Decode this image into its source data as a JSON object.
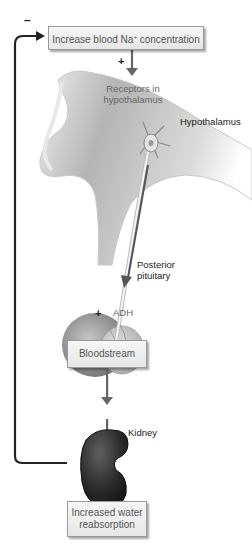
{
  "diagram": {
    "boxes": {
      "stimulus": "Increase blood Na",
      "stimulus_sup": "+",
      "stimulus_tail": " concentration",
      "bloodstream": "Bloodstream",
      "response_line1": "Increased water",
      "response_line2": "reabsorption"
    },
    "labels": {
      "receptors_line1": "Receptors in",
      "receptors_line2": "hypothalamus",
      "hypothalamus": "Hypothalamus",
      "posterior_line1": "Posterior",
      "posterior_line2": "pituitary",
      "adh": "ADH",
      "kidney": "Kidney"
    },
    "signs": {
      "feedback": "–",
      "stimulus_plus": "+",
      "adh_plus": "+"
    },
    "colors": {
      "arrow": "#666666",
      "feedback_line": "#222222",
      "brain": "#bdbdbd",
      "kidney": "#2a2a2a"
    }
  }
}
